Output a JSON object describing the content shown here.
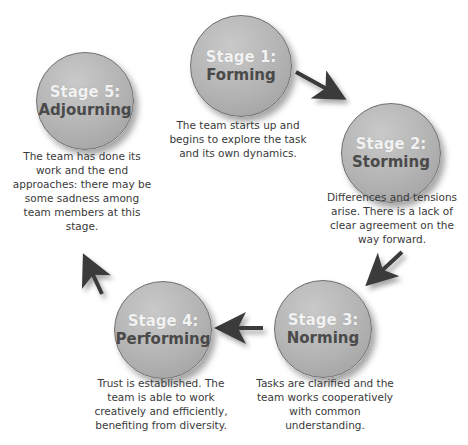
{
  "diagram": {
    "type": "cycle",
    "stages": [
      {
        "number": "Stage 1:",
        "name": "Forming",
        "description": "The team starts up and begins to explore the task and its own dynamics."
      },
      {
        "number": "Stage 2:",
        "name": "Storming",
        "description": "Differences and tensions arise. There is a lack of clear agreement on the way forward."
      },
      {
        "number": "Stage 3:",
        "name": "Norming",
        "description": "Tasks are clarified and the team works cooperatively with common understanding."
      },
      {
        "number": "Stage 4:",
        "name": "Performing",
        "description": "Trust is established. The team is able to work creatively and efficiently, benefiting from diversity."
      },
      {
        "number": "Stage 5:",
        "name": "Adjourning",
        "description": "The team has done its work and the end approaches: there may be some sadness among team members at this stage."
      }
    ],
    "arrows": [
      {
        "from": "Stage 1",
        "to": "Stage 2"
      },
      {
        "from": "Stage 2",
        "to": "Stage 3"
      },
      {
        "from": "Stage 3",
        "to": "Stage 4"
      },
      {
        "from": "Stage 4",
        "to": "Stage 5"
      }
    ],
    "colors": {
      "circle": "#b3b3b3",
      "circle_border": "#6e6e6e",
      "stage_number_text": "#f2f2f2",
      "stage_name_text": "#4a4a4a",
      "arrow": "#3a3a3a"
    }
  }
}
